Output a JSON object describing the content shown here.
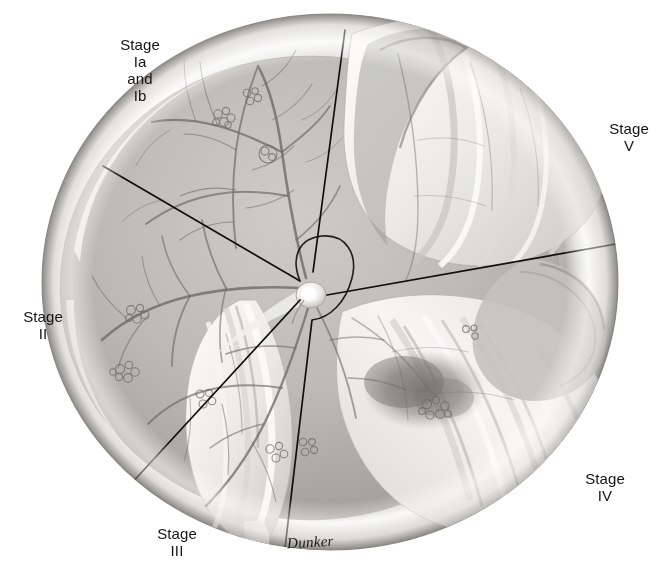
{
  "figure": {
    "background_color": "#ffffff",
    "ink_color": "#111111",
    "globe": {
      "center_x": 330,
      "center_y": 282,
      "radius_x": 288,
      "radius_y": 268,
      "rim_light_color": "#f2f1ef",
      "rim_shadow_color": "#8e8d8a",
      "interior_base_color": "#b9b8b4"
    },
    "optic_disc": {
      "center_x": 311,
      "center_y": 295,
      "radius": 14,
      "color": "#f4f3f1"
    }
  },
  "labels": [
    {
      "name": "stage-label-1",
      "text": "Stage\nIa\nand\nIb",
      "stage": "Ia and Ib",
      "x": 104,
      "y": 36,
      "width": 72
    },
    {
      "name": "stage-label-5",
      "text": "Stage\nV",
      "stage": "V",
      "x": 596,
      "y": 120,
      "width": 66
    },
    {
      "name": "stage-label-2",
      "text": "Stage\nII",
      "stage": "II",
      "x": 10,
      "y": 308,
      "width": 66
    },
    {
      "name": "stage-label-4",
      "text": "Stage\nIV",
      "stage": "IV",
      "x": 572,
      "y": 470,
      "width": 66
    },
    {
      "name": "stage-label-3",
      "text": "Stage\nIII",
      "stage": "III",
      "x": 144,
      "y": 525,
      "width": 66
    }
  ],
  "signature": {
    "text": "Dunker",
    "x": 287,
    "y": 534
  },
  "sector_dividers": [
    {
      "name": "divider-superior",
      "from_x": 345,
      "from_y": 30,
      "to_x": 313,
      "to_y": 272
    },
    {
      "name": "divider-left",
      "from_x": 103,
      "from_y": 166,
      "to_x": 300,
      "to_y": 281
    },
    {
      "name": "divider-inferior-left",
      "from_x": 129,
      "from_y": 486,
      "to_x": 300,
      "to_y": 300
    },
    {
      "name": "divider-inferior",
      "from_x": 285,
      "from_y": 548,
      "to_x": 312,
      "to_y": 320
    },
    {
      "name": "divider-right",
      "from_x": 616,
      "from_y": 244,
      "to_x": 327,
      "to_y": 295
    }
  ]
}
